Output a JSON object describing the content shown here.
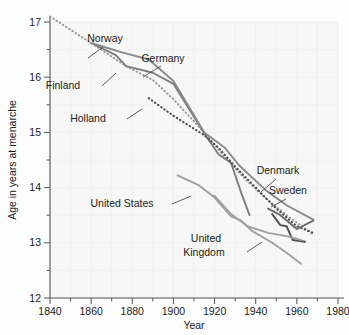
{
  "chart_data": {
    "type": "line",
    "title": "",
    "xlabel": "Year",
    "ylabel": "Age in years at menarche",
    "xlim": [
      1840,
      1980
    ],
    "ylim": [
      12,
      17
    ],
    "xticks": [
      1840,
      1860,
      1880,
      1900,
      1920,
      1940,
      1960,
      1980
    ],
    "yticks": [
      12,
      13,
      14,
      15,
      16,
      17
    ],
    "x_minor_step": 10,
    "y_minor_step": 0.5,
    "grid": "faint",
    "legend": "inline-labels-with-leader-lines",
    "series": [
      {
        "name": "Norway",
        "style": "dotted",
        "color": "#9a9a9a",
        "points": [
          [
            1840,
            17.1
          ],
          [
            1860,
            16.62
          ],
          [
            1877,
            16.2
          ],
          [
            1890,
            15.95
          ],
          [
            1900,
            15.6
          ],
          [
            1915,
            15.0
          ],
          [
            1925,
            14.55
          ],
          [
            1935,
            14.15
          ],
          [
            1945,
            13.8
          ],
          [
            1955,
            13.5
          ],
          [
            1968,
            13.15
          ]
        ]
      },
      {
        "name": "Finland",
        "style": "solid",
        "color": "#7d7d7d",
        "points": [
          [
            1860,
            16.62
          ],
          [
            1872,
            16.4
          ],
          [
            1877,
            16.2
          ],
          [
            1890,
            16.08
          ],
          [
            1900,
            15.88
          ],
          [
            1915,
            14.98
          ],
          [
            1922,
            14.6
          ],
          [
            1928,
            14.45
          ],
          [
            1933,
            13.9
          ],
          [
            1937,
            13.5
          ]
        ]
      },
      {
        "name": "Germany",
        "style": "solid",
        "color": "#8a8a8a",
        "points": [
          [
            1860,
            16.62
          ],
          [
            1875,
            16.45
          ],
          [
            1888,
            16.32
          ],
          [
            1900,
            15.93
          ],
          [
            1915,
            15.0
          ],
          [
            1925,
            14.72
          ],
          [
            1932,
            14.4
          ],
          [
            1945,
            13.95
          ],
          [
            1955,
            13.68
          ],
          [
            1968,
            13.42
          ]
        ]
      },
      {
        "name": "Holland",
        "style": "dotted",
        "color": "#4a4a4a",
        "points": [
          [
            1888,
            15.62
          ],
          [
            1900,
            15.3
          ],
          [
            1915,
            14.95
          ],
          [
            1922,
            14.72
          ],
          [
            1930,
            14.38
          ],
          [
            1940,
            14.0
          ],
          [
            1950,
            13.62
          ],
          [
            1960,
            13.3
          ],
          [
            1968,
            13.18
          ]
        ]
      },
      {
        "name": "Denmark",
        "style": "solid",
        "color": "#6a6a6a",
        "points": [
          [
            1946,
            13.62
          ],
          [
            1952,
            13.5
          ],
          [
            1960,
            13.25
          ],
          [
            1968,
            13.4
          ]
        ]
      },
      {
        "name": "Sweden",
        "style": "solid",
        "color": "#4f4f4f",
        "points": [
          [
            1948,
            13.52
          ],
          [
            1952,
            13.32
          ],
          [
            1955,
            13.3
          ],
          [
            1958,
            13.05
          ],
          [
            1964,
            13.02
          ]
        ]
      },
      {
        "name": "United States",
        "style": "solid",
        "color": "#a0a0a0",
        "points": [
          [
            1902,
            14.22
          ],
          [
            1912,
            14.05
          ],
          [
            1920,
            13.82
          ],
          [
            1928,
            13.48
          ],
          [
            1933,
            13.4
          ],
          [
            1938,
            13.22
          ],
          [
            1948,
            13.0
          ],
          [
            1955,
            12.82
          ],
          [
            1962,
            12.62
          ]
        ]
      },
      {
        "name": "United Kingdom",
        "style": "solid",
        "color": "#a0a0a0",
        "points": [
          [
            1920,
            13.85
          ],
          [
            1928,
            13.52
          ],
          [
            1936,
            13.3
          ],
          [
            1946,
            13.18
          ],
          [
            1955,
            13.12
          ],
          [
            1962,
            13.05
          ]
        ]
      }
    ],
    "annotations": [
      {
        "label": "Norway",
        "x": 105,
        "y": 42
      },
      {
        "label": "Germany",
        "x": 163,
        "y": 62
      },
      {
        "label": "Finland",
        "x": 63,
        "y": 89
      },
      {
        "label": "Holland",
        "x": 88,
        "y": 122
      },
      {
        "label": "Denmark",
        "x": 278,
        "y": 174
      },
      {
        "label": "Sweden",
        "x": 288,
        "y": 194
      },
      {
        "label": "United States",
        "x": 122,
        "y": 207
      },
      {
        "label": "United",
        "x": 206,
        "y": 242
      },
      {
        "label": "Kingdom",
        "x": 204,
        "y": 256
      }
    ]
  }
}
